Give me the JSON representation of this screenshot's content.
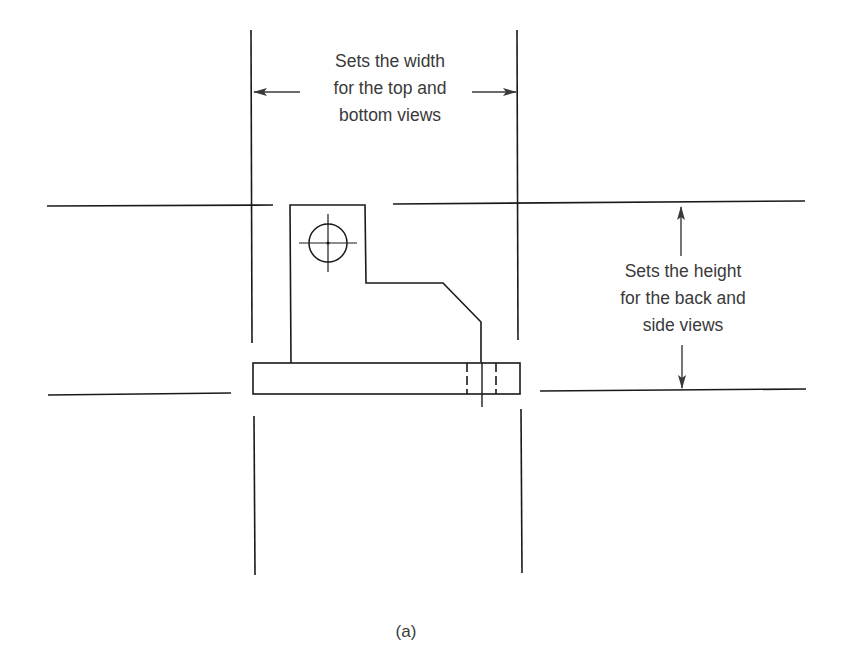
{
  "figure": {
    "caption": "(a)",
    "width_annotation": {
      "lines": [
        "Sets the width",
        "for the top and",
        "bottom views"
      ]
    },
    "height_annotation": {
      "lines": [
        "Sets the height",
        "for the back and",
        "side views"
      ]
    },
    "colors": {
      "line": "#1a1a1a",
      "text": "#3a3a3a",
      "background": "#ffffff"
    }
  }
}
